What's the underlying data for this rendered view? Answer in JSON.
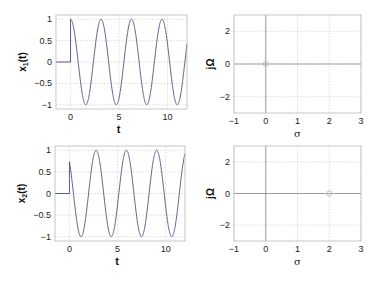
{
  "chart_data": [
    {
      "id": "x1",
      "type": "line",
      "title": "",
      "xlabel": "t",
      "ylabel": "x1(t)",
      "ylabel_main": "x",
      "ylabel_sub": "1",
      "ylabel_tail": "(t)",
      "xlim": [
        -1.5,
        12
      ],
      "ylim": [
        -1.1,
        1.1
      ],
      "xticks": [
        0,
        5,
        10
      ],
      "yticks": [
        -1,
        -0.5,
        0,
        0.5,
        1
      ],
      "ytick_labels": [
        "−1",
        "−0.5",
        "0",
        "0.5",
        "1"
      ],
      "grid": true,
      "series": [
        {
          "name": "x1(t)",
          "color": "#5a5f8a",
          "formula": "0 for t<0; cos(2t) for t>=0",
          "amplitude": 1,
          "omega": 2,
          "phase": 0
        }
      ]
    },
    {
      "id": "s1",
      "type": "scatter",
      "title": "",
      "xlabel": "σ",
      "ylabel": "jΩ",
      "xlim": [
        -1,
        3
      ],
      "ylim": [
        -3,
        3
      ],
      "xticks": [
        -1,
        0,
        1,
        2,
        3
      ],
      "xtick_labels": [
        "−1",
        "0",
        "1",
        "2",
        "3"
      ],
      "yticks": [
        -2,
        0,
        2
      ],
      "ytick_labels": [
        "−2",
        "0",
        "2"
      ],
      "grid": true,
      "markers": [
        {
          "sigma": 0,
          "omega": 0,
          "shape": "circle"
        }
      ]
    },
    {
      "id": "x2",
      "type": "line",
      "title": "",
      "xlabel": "t",
      "ylabel": "x2(t)",
      "ylabel_main": "x",
      "ylabel_sub": "2",
      "ylabel_tail": "(t)",
      "xlim": [
        -1.5,
        12
      ],
      "ylim": [
        -1.1,
        1.1
      ],
      "xticks": [
        0,
        5,
        10
      ],
      "yticks": [
        -1,
        -0.5,
        0,
        0.5,
        1
      ],
      "ytick_labels": [
        "−1",
        "−0.5",
        "0",
        "0.5",
        "1"
      ],
      "grid": true,
      "series": [
        {
          "name": "x2(t)",
          "color": "#5a5f8a",
          "formula": "0 for t<0; cos(2t + 0.74) for t>=0",
          "amplitude": 1,
          "omega": 2,
          "phase": 0.74
        }
      ]
    },
    {
      "id": "s2",
      "type": "scatter",
      "title": "",
      "xlabel": "σ",
      "ylabel": "jΩ",
      "xlim": [
        -1,
        3
      ],
      "ylim": [
        -3,
        3
      ],
      "xticks": [
        -1,
        0,
        1,
        2,
        3
      ],
      "xtick_labels": [
        "−1",
        "0",
        "1",
        "2",
        "3"
      ],
      "yticks": [
        -2,
        0,
        2
      ],
      "ytick_labels": [
        "−2",
        "0",
        "2"
      ],
      "grid": true,
      "markers": [
        {
          "sigma": 2,
          "omega": 0,
          "shape": "circle"
        }
      ]
    }
  ],
  "layout": {
    "panels": [
      {
        "id": "x1",
        "left": 56,
        "top": 15,
        "right": 187,
        "bottom": 109
      },
      {
        "id": "s1",
        "left": 234,
        "top": 15,
        "right": 361,
        "bottom": 113
      },
      {
        "id": "x2",
        "left": 55,
        "top": 146,
        "right": 185,
        "bottom": 241
      },
      {
        "id": "s2",
        "left": 234,
        "top": 146,
        "right": 361,
        "bottom": 241
      }
    ],
    "colors": {
      "frame": "#b8b8b8",
      "grid": "#c8c8c8",
      "axis": "#8a8a8a",
      "line": "#5a5f8a",
      "marker": "#c0c0c0"
    }
  }
}
